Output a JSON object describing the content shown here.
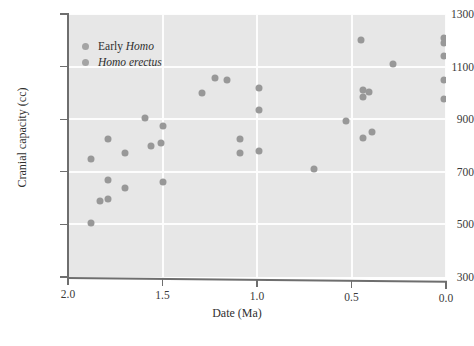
{
  "chart_data": {
    "type": "scatter",
    "title": "",
    "xlabel": "Date (Ma)",
    "ylabel": "Cranial capacity (cc)",
    "xlim": [
      2.0,
      0.0
    ],
    "ylim": [
      300,
      1300
    ],
    "x_inverted": true,
    "xticks": [
      "2.0",
      "1.5",
      "1.0",
      "0.5",
      "0.0"
    ],
    "xtick_values": [
      2.0,
      1.5,
      1.0,
      0.5,
      0.0
    ],
    "yticks": [
      "300",
      "500",
      "700",
      "900",
      "1100",
      "1300"
    ],
    "ytick_values": [
      300,
      500,
      700,
      900,
      1100,
      1300
    ],
    "grid": true,
    "grid_color": "#fdfdfd",
    "plot_background": "#e7e7e7",
    "marker_color": "#989898",
    "legend_position": "top-left",
    "legend": [
      {
        "label_plain": "Early ",
        "label_italic": "Homo",
        "full": "Early Homo"
      },
      {
        "label_plain": "",
        "label_italic": "Homo erectus",
        "full": "Homo erectus"
      }
    ],
    "points": [
      {
        "x": 1.88,
        "y": 505
      },
      {
        "x": 1.88,
        "y": 750
      },
      {
        "x": 1.83,
        "y": 590
      },
      {
        "x": 1.79,
        "y": 595
      },
      {
        "x": 1.79,
        "y": 670
      },
      {
        "x": 1.79,
        "y": 825
      },
      {
        "x": 1.7,
        "y": 640
      },
      {
        "x": 1.7,
        "y": 770
      },
      {
        "x": 1.59,
        "y": 905
      },
      {
        "x": 1.56,
        "y": 800
      },
      {
        "x": 1.51,
        "y": 810
      },
      {
        "x": 1.5,
        "y": 660
      },
      {
        "x": 1.5,
        "y": 875
      },
      {
        "x": 1.29,
        "y": 1000
      },
      {
        "x": 1.22,
        "y": 1055
      },
      {
        "x": 1.16,
        "y": 1050
      },
      {
        "x": 1.09,
        "y": 825
      },
      {
        "x": 1.09,
        "y": 770
      },
      {
        "x": 0.99,
        "y": 1020
      },
      {
        "x": 0.99,
        "y": 935
      },
      {
        "x": 0.99,
        "y": 780
      },
      {
        "x": 0.7,
        "y": 710
      },
      {
        "x": 0.53,
        "y": 895
      },
      {
        "x": 0.45,
        "y": 1200
      },
      {
        "x": 0.44,
        "y": 1010
      },
      {
        "x": 0.44,
        "y": 985
      },
      {
        "x": 0.44,
        "y": 830
      },
      {
        "x": 0.41,
        "y": 1005
      },
      {
        "x": 0.39,
        "y": 850
      },
      {
        "x": 0.28,
        "y": 1110
      },
      {
        "x": 0.01,
        "y": 1210
      },
      {
        "x": 0.01,
        "y": 1190
      },
      {
        "x": 0.01,
        "y": 1140
      },
      {
        "x": 0.01,
        "y": 1050
      },
      {
        "x": 0.01,
        "y": 975
      }
    ]
  }
}
